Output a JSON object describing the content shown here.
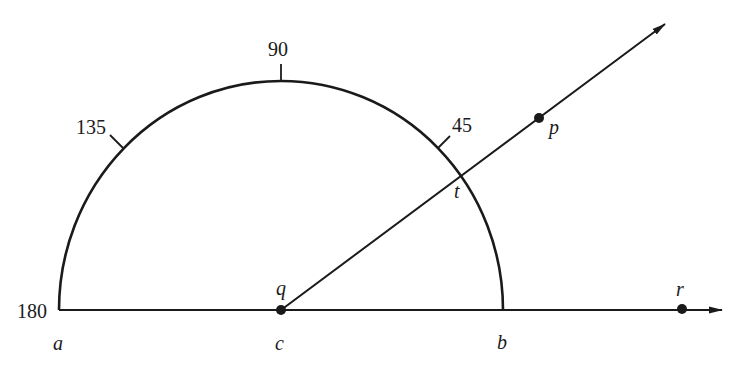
{
  "diagram": {
    "type": "protractor-angle",
    "colors": {
      "ink": "#1a1a1a",
      "background": "#ffffff"
    },
    "scale_labels": {
      "deg_180": "180",
      "deg_135": "135",
      "deg_90": "90",
      "deg_45": "45"
    },
    "point_labels": {
      "a": "a",
      "b": "b",
      "c": "c",
      "q": "q",
      "t": "t",
      "p": "p",
      "r": "r"
    },
    "elements": {
      "protractor_arc": "semicircle from a (180) to b (0) centered at c",
      "baseline": "line from a through c, b, r with arrow",
      "ray_qp": "ray from q through t and p with arrow"
    }
  }
}
